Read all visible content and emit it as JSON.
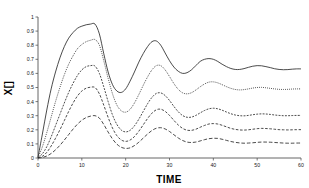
{
  "chart_data": {
    "type": "line",
    "title": "",
    "xlabel": "TIME",
    "ylabel": "X[]",
    "xlim": [
      0,
      60
    ],
    "ylim": [
      0,
      1
    ],
    "grid": false,
    "legend": "none",
    "xticks": [
      "0",
      "10",
      "20",
      "30",
      "40",
      "50",
      "60"
    ],
    "xtick_values": [
      0,
      10,
      20,
      30,
      40,
      50,
      60
    ],
    "yticks": [
      "0",
      "0.1",
      "0.2",
      "0.3",
      "0.4",
      "0.5",
      "0.6",
      "0.7",
      "0.8",
      "0.9",
      "1"
    ],
    "ytick_values": [
      0,
      0.1,
      0.2,
      0.3,
      0.4,
      0.5,
      0.6,
      0.7,
      0.8,
      0.9,
      1
    ],
    "x": [
      0,
      1,
      2,
      3,
      4,
      5,
      6,
      7,
      8,
      9,
      10,
      11,
      12,
      13,
      14,
      15,
      16,
      17,
      18,
      19,
      20,
      21,
      22,
      23,
      24,
      25,
      26,
      27,
      28,
      29,
      30,
      31,
      32,
      33,
      34,
      35,
      36,
      37,
      38,
      39,
      40,
      41,
      42,
      43,
      44,
      45,
      46,
      47,
      48,
      49,
      50,
      51,
      52,
      53,
      54,
      55,
      56,
      57,
      58,
      59,
      60
    ],
    "series": [
      {
        "name": "curve-1",
        "style": "solid",
        "steady_state": 0.63,
        "peak": 0.95,
        "peak_time": 13,
        "values": [
          0.005,
          0.17,
          0.34,
          0.49,
          0.61,
          0.71,
          0.79,
          0.85,
          0.89,
          0.92,
          0.935,
          0.945,
          0.95,
          0.95,
          0.88,
          0.74,
          0.61,
          0.52,
          0.475,
          0.465,
          0.49,
          0.545,
          0.61,
          0.68,
          0.74,
          0.79,
          0.825,
          0.83,
          0.8,
          0.745,
          0.69,
          0.645,
          0.615,
          0.6,
          0.605,
          0.625,
          0.655,
          0.685,
          0.7,
          0.705,
          0.7,
          0.685,
          0.665,
          0.648,
          0.635,
          0.628,
          0.628,
          0.634,
          0.643,
          0.651,
          0.655,
          0.654,
          0.648,
          0.641,
          0.633,
          0.628,
          0.626,
          0.627,
          0.63,
          0.632,
          0.632
        ]
      },
      {
        "name": "curve-2",
        "style": "dotted",
        "steady_state": 0.49,
        "peak": 0.84,
        "peak_time": 13.5,
        "values": [
          0.003,
          0.08,
          0.18,
          0.29,
          0.4,
          0.5,
          0.59,
          0.665,
          0.725,
          0.775,
          0.805,
          0.825,
          0.835,
          0.84,
          0.8,
          0.69,
          0.565,
          0.455,
          0.375,
          0.335,
          0.325,
          0.345,
          0.39,
          0.45,
          0.515,
          0.575,
          0.625,
          0.655,
          0.655,
          0.625,
          0.578,
          0.528,
          0.487,
          0.462,
          0.455,
          0.463,
          0.482,
          0.505,
          0.525,
          0.538,
          0.54,
          0.533,
          0.52,
          0.506,
          0.494,
          0.486,
          0.483,
          0.485,
          0.49,
          0.496,
          0.5,
          0.501,
          0.498,
          0.494,
          0.49,
          0.487,
          0.486,
          0.487,
          0.489,
          0.49,
          0.49
        ]
      },
      {
        "name": "curve-3",
        "style": "dash-short",
        "steady_state": 0.3,
        "peak": 0.655,
        "peak_time": 13.5,
        "values": [
          0.002,
          0.03,
          0.08,
          0.15,
          0.23,
          0.31,
          0.39,
          0.465,
          0.53,
          0.585,
          0.625,
          0.648,
          0.655,
          0.652,
          0.6,
          0.505,
          0.4,
          0.305,
          0.238,
          0.198,
          0.185,
          0.196,
          0.228,
          0.275,
          0.33,
          0.385,
          0.43,
          0.458,
          0.462,
          0.443,
          0.408,
          0.366,
          0.328,
          0.301,
          0.289,
          0.29,
          0.302,
          0.32,
          0.337,
          0.349,
          0.353,
          0.349,
          0.339,
          0.326,
          0.314,
          0.305,
          0.3,
          0.299,
          0.302,
          0.307,
          0.311,
          0.313,
          0.312,
          0.309,
          0.305,
          0.302,
          0.3,
          0.3,
          0.301,
          0.302,
          0.302
        ]
      },
      {
        "name": "curve-4",
        "style": "dash-medium",
        "steady_state": 0.2,
        "peak": 0.5,
        "peak_time": 13.5,
        "values": [
          0.001,
          0.012,
          0.04,
          0.085,
          0.14,
          0.2,
          0.265,
          0.33,
          0.39,
          0.44,
          0.475,
          0.495,
          0.502,
          0.5,
          0.455,
          0.375,
          0.288,
          0.212,
          0.158,
          0.128,
          0.118,
          0.127,
          0.152,
          0.19,
          0.235,
          0.28,
          0.318,
          0.342,
          0.346,
          0.331,
          0.302,
          0.267,
          0.234,
          0.21,
          0.197,
          0.196,
          0.204,
          0.218,
          0.231,
          0.241,
          0.244,
          0.241,
          0.232,
          0.221,
          0.21,
          0.203,
          0.199,
          0.198,
          0.2,
          0.204,
          0.208,
          0.21,
          0.209,
          0.207,
          0.204,
          0.201,
          0.2,
          0.199,
          0.2,
          0.201,
          0.201
        ]
      },
      {
        "name": "curve-5",
        "style": "dash-long",
        "steady_state": 0.1,
        "peak": 0.3,
        "peak_time": 14,
        "values": [
          0.0,
          0.004,
          0.014,
          0.032,
          0.058,
          0.09,
          0.127,
          0.166,
          0.205,
          0.24,
          0.268,
          0.287,
          0.297,
          0.3,
          0.283,
          0.238,
          0.184,
          0.135,
          0.098,
          0.076,
          0.068,
          0.072,
          0.088,
          0.112,
          0.141,
          0.17,
          0.195,
          0.211,
          0.215,
          0.206,
          0.188,
          0.165,
          0.142,
          0.124,
          0.113,
          0.11,
          0.113,
          0.121,
          0.13,
          0.137,
          0.14,
          0.139,
          0.133,
          0.125,
          0.117,
          0.111,
          0.107,
          0.105,
          0.106,
          0.108,
          0.111,
          0.113,
          0.113,
          0.112,
          0.11,
          0.108,
          0.106,
          0.105,
          0.105,
          0.106,
          0.106
        ]
      }
    ]
  },
  "axes": {
    "xlabel": "TIME",
    "ylabel": "X[]"
  }
}
